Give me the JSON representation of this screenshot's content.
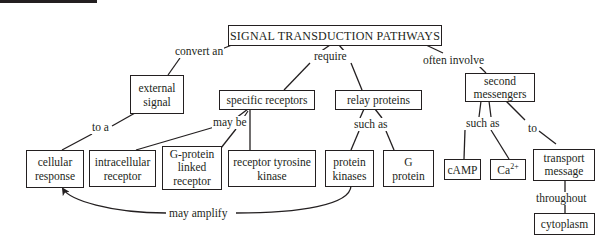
{
  "diagram": {
    "title": "SIGNAL TRANSDUCTION PATHWAYS",
    "nodes": {
      "external_signal": [
        "external",
        "signal"
      ],
      "cellular_response": [
        "cellular",
        "response"
      ],
      "specific_receptors": "specific receptors",
      "relay_proteins": "relay proteins",
      "second_messengers": [
        "second",
        "messengers"
      ],
      "intracellular_receptor": [
        "intracellular",
        "receptor"
      ],
      "g_protein_linked_receptor": [
        "G-protein",
        "linked",
        "receptor"
      ],
      "receptor_tyrosine_kinase": [
        "receptor tyrosine",
        "kinase"
      ],
      "protein_kinases": [
        "protein",
        "kinases"
      ],
      "g_protein": [
        "G",
        "protein"
      ],
      "camp": "cAMP",
      "calcium": {
        "base": "Ca",
        "superscript": "2+"
      },
      "transport_message": [
        "transport",
        "message"
      ],
      "cytoplasm": "cytoplasm"
    },
    "links": {
      "convert_an": "convert an",
      "require": "require",
      "often_involve": "often involve",
      "to_a": "to a",
      "may_be": "may be",
      "such_as_relay": "such as",
      "such_as_messengers": "such as",
      "to": "to",
      "throughout": "throughout",
      "may_amplify": "may amplify"
    }
  }
}
